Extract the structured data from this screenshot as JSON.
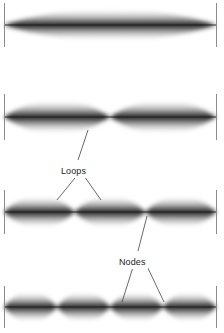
{
  "figure": {
    "background_color": "#ffffff",
    "ink_color": "#1a1a1a",
    "end_bar_color": "#8b8b8b",
    "width": 224,
    "height": 333,
    "string_left_x": 4,
    "string_right_x": 216
  },
  "labels": {
    "loops": "Loops",
    "nodes": "Nodes"
  },
  "harmonics": [
    {
      "name": "first-harmonic",
      "loop_count": 1,
      "center_y": 25,
      "amplitude": 21,
      "node_positions": [
        4,
        216
      ],
      "antinode_positions": [
        110
      ]
    },
    {
      "name": "second-harmonic",
      "loop_count": 2,
      "center_y": 117,
      "amplitude": 22,
      "node_positions": [
        4,
        110,
        216
      ],
      "antinode_positions": [
        57,
        163
      ]
    },
    {
      "name": "third-harmonic",
      "loop_count": 3,
      "center_y": 212,
      "amplitude": 21,
      "node_positions": [
        4,
        75,
        146,
        216
      ],
      "antinode_positions": [
        39,
        110,
        181
      ]
    },
    {
      "name": "fourth-harmonic",
      "loop_count": 4,
      "center_y": 307,
      "amplitude": 20,
      "node_positions": [
        4,
        57,
        110,
        163,
        216
      ],
      "antinode_positions": [
        30,
        83,
        136,
        189
      ]
    }
  ],
  "leader_lines": [
    {
      "name": "loops-leader-up",
      "from": [
        78,
        160
      ],
      "to": [
        88,
        130
      ]
    },
    {
      "name": "loops-leader-down-left",
      "from": [
        79,
        173
      ],
      "to": [
        57,
        200
      ]
    },
    {
      "name": "loops-leader-down-right",
      "from": [
        82,
        173
      ],
      "to": [
        101,
        200
      ]
    },
    {
      "name": "nodes-leader-up",
      "from": [
        138,
        251
      ],
      "to": [
        147,
        216
      ]
    },
    {
      "name": "nodes-leader-down-left",
      "from": [
        134,
        264
      ],
      "to": [
        122,
        302
      ]
    },
    {
      "name": "nodes-leader-down-right",
      "from": [
        146,
        264
      ],
      "to": [
        164,
        302
      ]
    }
  ]
}
